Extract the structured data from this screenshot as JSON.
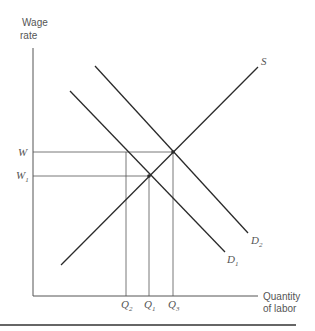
{
  "diagram": {
    "type": "supply-demand labor market",
    "y_axis_label": [
      "Wage",
      "rate"
    ],
    "x_axis_label": [
      "Quantity",
      "of labor"
    ],
    "curves": [
      {
        "name": "S",
        "label": "S",
        "sub": ""
      },
      {
        "name": "D1",
        "label": "D",
        "sub": "1"
      },
      {
        "name": "D2",
        "label": "D",
        "sub": "2"
      }
    ],
    "y_ticks": [
      {
        "label": "W",
        "sub": ""
      },
      {
        "label": "W",
        "sub": "1"
      }
    ],
    "x_ticks": [
      {
        "label": "Q",
        "sub": "2"
      },
      {
        "label": "Q",
        "sub": "1"
      },
      {
        "label": "Q",
        "sub": "3"
      }
    ],
    "colors": {
      "line": "#2a2a2a",
      "guide": "#555555",
      "text": "#555555"
    }
  }
}
